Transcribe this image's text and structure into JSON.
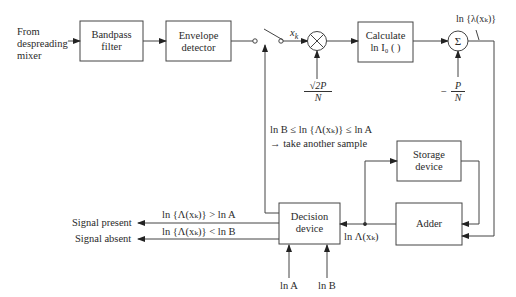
{
  "diagram": {
    "input_label": [
      "From",
      "despreading",
      "mixer"
    ],
    "blocks": {
      "bandpass": [
        "Bandpass",
        "filter"
      ],
      "envelope": [
        "Envelope",
        "detector"
      ],
      "calc": [
        "Calculate",
        "ln I₀ (  )"
      ],
      "storage": [
        "Storage",
        "device"
      ],
      "adder": "Adder",
      "decision": [
        "Decision",
        "device"
      ]
    },
    "multiplier_symbol": "⊗",
    "summer_symbol": "Σ",
    "signals": {
      "xk": "x",
      "xk_sub": "k",
      "mult_gain_num": "√2P",
      "mult_gain_den": "N",
      "bias_sign": "−",
      "bias_num": "P",
      "bias_den": "N",
      "lambda_out": "ln {λ(xₖ)}",
      "cond_continue_1": "ln B ≤ ln {Λ(xₖ)} ≤ ln A",
      "cond_continue_2": "→ take another sample",
      "adder_out": "ln Λ(xₖ)",
      "cond_present": "ln {Λ(xₖ)} > ln A",
      "cond_absent": "ln {Λ(xₖ)} < ln B",
      "out_present": "Signal present",
      "out_absent": "Signal absent",
      "thresh_a": "ln A",
      "thresh_b": "ln B"
    }
  }
}
